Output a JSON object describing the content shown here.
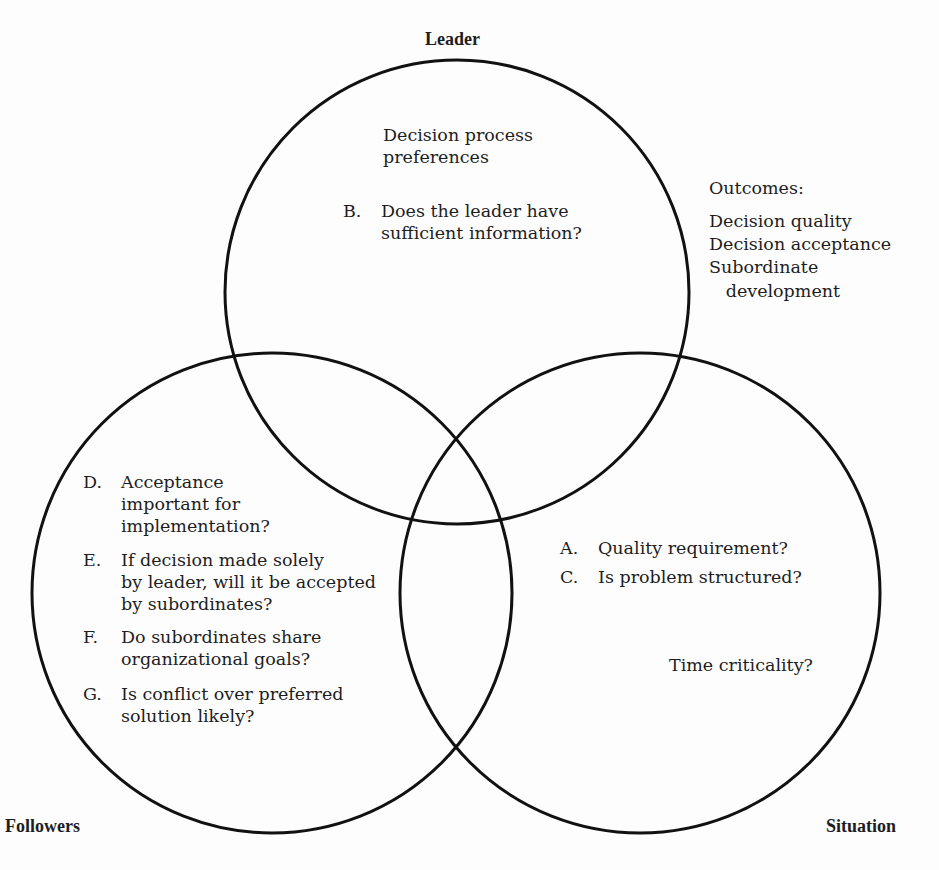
{
  "diagram": {
    "circles": [
      {
        "name": "Leader",
        "cx": 457,
        "cy": 292,
        "r": 232
      },
      {
        "name": "Followers",
        "cx": 272,
        "cy": 593,
        "r": 240
      },
      {
        "name": "Situation",
        "cx": 640,
        "cy": 593,
        "r": 240
      }
    ],
    "stroke_color": "#111111",
    "labels": {
      "leader": "Leader",
      "followers": "Followers",
      "situation": "Situation"
    },
    "leader_region": {
      "heading": "Decision process\npreferences",
      "items": [
        {
          "letter": "B.",
          "text": "Does the leader have\nsufficient information?"
        }
      ]
    },
    "outcomes": {
      "title": "Outcomes:",
      "lines": [
        "Decision quality",
        "Decision acceptance",
        "Subordinate",
        "   development"
      ]
    },
    "followers_region": {
      "items": [
        {
          "letter": "D.",
          "text": "Acceptance\nimportant for\nimplementation?"
        },
        {
          "letter": "E.",
          "text": "If decision made solely\nby leader, will it be accepted\nby subordinates?"
        },
        {
          "letter": "F.",
          "text": "Do subordinates share\norganizational goals?"
        },
        {
          "letter": "G.",
          "text": "Is conflict over preferred\nsolution likely?"
        }
      ]
    },
    "situation_region": {
      "items": [
        {
          "letter": "A.",
          "text": "Quality requirement?"
        },
        {
          "letter": "C.",
          "text": "Is problem structured?"
        }
      ],
      "extra": "Time criticality?"
    }
  }
}
